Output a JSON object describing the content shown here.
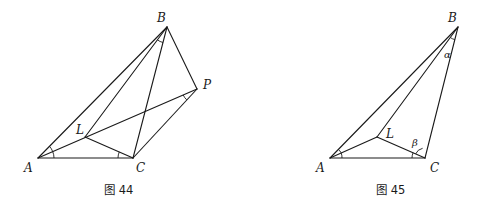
{
  "figures": [
    {
      "id": "fig44",
      "caption": "图 44",
      "points": {
        "A": {
          "label": "A",
          "x": 38,
          "y": 158
        },
        "B": {
          "label": "B",
          "x": 167,
          "y": 27
        },
        "C": {
          "label": "C",
          "x": 133,
          "y": 158
        },
        "L": {
          "label": "L",
          "x": 85,
          "y": 137
        },
        "P": {
          "label": "P",
          "x": 197,
          "y": 89
        }
      },
      "segments": [
        [
          "A",
          "B"
        ],
        [
          "A",
          "C"
        ],
        [
          "B",
          "C"
        ],
        [
          "B",
          "P"
        ],
        [
          "C",
          "P"
        ],
        [
          "A",
          "P"
        ],
        [
          "B",
          "L"
        ],
        [
          "L",
          "C"
        ]
      ],
      "angle_marks": [
        "angle BAL at A",
        "angle LCA at C",
        "angle LBC at B",
        "angle APC at P"
      ]
    },
    {
      "id": "fig45",
      "caption": "图 45",
      "points": {
        "A": {
          "label": "A",
          "x": 330,
          "y": 158
        },
        "B": {
          "label": "B",
          "x": 458,
          "y": 27
        },
        "C": {
          "label": "C",
          "x": 425,
          "y": 158
        },
        "L": {
          "label": "L",
          "x": 377,
          "y": 137
        }
      },
      "greek": {
        "alpha": "α",
        "beta": "β"
      },
      "segments": [
        [
          "A",
          "B"
        ],
        [
          "A",
          "C"
        ],
        [
          "B",
          "C"
        ],
        [
          "A",
          "L"
        ],
        [
          "B",
          "L"
        ],
        [
          "L",
          "C"
        ]
      ],
      "angle_marks": [
        "angle BAL at A",
        "angle LAC at A",
        "angle LCA at C",
        "angle BCL = β",
        "angle LBC = α"
      ]
    }
  ]
}
